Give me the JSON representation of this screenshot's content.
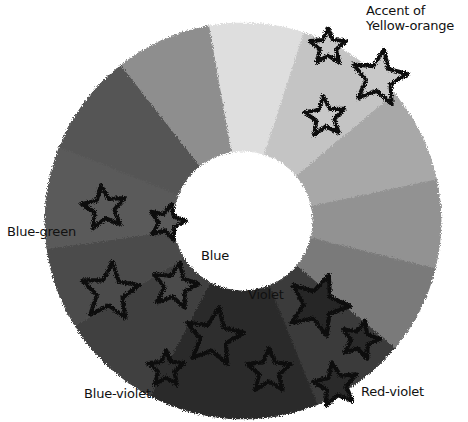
{
  "diagram": {
    "type": "color-wheel",
    "title": "",
    "center": [
      243,
      221
    ],
    "outer_radius": 198,
    "inner_radius": 70,
    "segments": [
      {
        "name": "Yellow",
        "start_deg": -100,
        "end_deg": -72,
        "fill": "#dedede"
      },
      {
        "name": "Yellow-orange",
        "start_deg": -72,
        "end_deg": -40,
        "fill": "#c4c4c4"
      },
      {
        "name": "Orange",
        "start_deg": -40,
        "end_deg": -12,
        "fill": "#a8a8a8"
      },
      {
        "name": "Red-orange",
        "start_deg": -12,
        "end_deg": 14,
        "fill": "#929292"
      },
      {
        "name": "Red",
        "start_deg": 14,
        "end_deg": 40,
        "fill": "#7a7a7a"
      },
      {
        "name": "Red-violet",
        "start_deg": 40,
        "end_deg": 68,
        "fill": "#3a3a3a"
      },
      {
        "name": "Violet",
        "start_deg": 68,
        "end_deg": 118,
        "fill": "#2a2a2a"
      },
      {
        "name": "Blue-violet",
        "start_deg": 118,
        "end_deg": 148,
        "fill": "#404040"
      },
      {
        "name": "Blue",
        "start_deg": 148,
        "end_deg": 172,
        "fill": "#4c4c4c"
      },
      {
        "name": "Blue-green",
        "start_deg": 172,
        "end_deg": 202,
        "fill": "#5a5a5a"
      },
      {
        "name": "Green",
        "start_deg": 202,
        "end_deg": 232,
        "fill": "#555555"
      },
      {
        "name": "Yellow-green",
        "start_deg": 232,
        "end_deg": 260,
        "fill": "#8e8e8e"
      }
    ],
    "stars": [
      {
        "x": 328,
        "y": 47,
        "r": 19,
        "fill": "#c8c8c8",
        "rot": 0
      },
      {
        "x": 379,
        "y": 78,
        "r": 29,
        "fill": "#c8c8c8",
        "rot": 10
      },
      {
        "x": 325,
        "y": 117,
        "r": 21,
        "fill": "#c8c8c8",
        "rot": -5
      },
      {
        "x": 104,
        "y": 208,
        "r": 23,
        "fill": "#5a5a5a",
        "rot": -8
      },
      {
        "x": 167,
        "y": 222,
        "r": 19,
        "fill": "#5a5a5a",
        "rot": 15
      },
      {
        "x": 110,
        "y": 292,
        "r": 30,
        "fill": "#4c4c4c",
        "rot": 5
      },
      {
        "x": 175,
        "y": 286,
        "r": 24,
        "fill": "#4c4c4c",
        "rot": 12
      },
      {
        "x": 214,
        "y": 337,
        "r": 30,
        "fill": "#2e2e2e",
        "rot": 10
      },
      {
        "x": 166,
        "y": 369,
        "r": 19,
        "fill": "#2e2e2e",
        "rot": 0
      },
      {
        "x": 269,
        "y": 371,
        "r": 23,
        "fill": "#2e2e2e",
        "rot": 0
      },
      {
        "x": 318,
        "y": 305,
        "r": 32,
        "fill": "#262626",
        "rot": 20
      },
      {
        "x": 360,
        "y": 340,
        "r": 20,
        "fill": "#2a2a2a",
        "rot": 15
      },
      {
        "x": 336,
        "y": 385,
        "r": 23,
        "fill": "#2a2a2a",
        "rot": -10
      }
    ]
  },
  "labels": {
    "accent": "Accent of\nYellow-orange",
    "blue_green": "Blue-green",
    "blue": "Blue",
    "violet": "Violet",
    "blue_violet": "Blue-violet",
    "red_violet": "Red-violet"
  }
}
